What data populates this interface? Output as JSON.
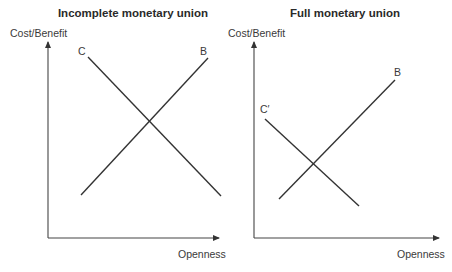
{
  "diagrams": [
    {
      "id": "left",
      "title": "Incomplete monetary union",
      "ylabel": "Cost/Benefit",
      "xlabel": "Openness",
      "curves": [
        {
          "label": "C",
          "meaning": "cost",
          "from": [
            88,
            57
          ],
          "to": [
            221,
            196
          ]
        },
        {
          "label": "B",
          "meaning": "benefit",
          "from": [
            81,
            195
          ],
          "to": [
            208,
            58
          ]
        }
      ]
    },
    {
      "id": "right",
      "title": "Full monetary union",
      "ylabel": "Cost/Benefit",
      "xlabel": "Openness",
      "curves": [
        {
          "label": "C′",
          "meaning": "cost",
          "from": [
            265,
            119
          ],
          "to": [
            359,
            206
          ]
        },
        {
          "label": "B",
          "meaning": "benefit",
          "from": [
            279,
            199
          ],
          "to": [
            395,
            80
          ]
        }
      ]
    }
  ],
  "colors": {
    "line": "#333333",
    "text": "#2b2b2b",
    "background": "#ffffff"
  }
}
